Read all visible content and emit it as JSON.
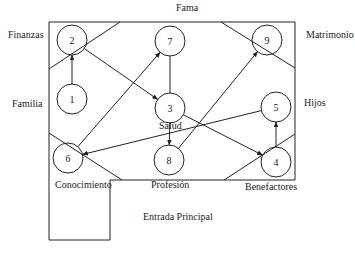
{
  "diagram": {
    "type": "bagua-map-graph",
    "regions": [
      {
        "id": "fama",
        "label": "Fama",
        "x": 176,
        "y": 8
      },
      {
        "id": "finanzas",
        "label": "Finanzas",
        "x": 8,
        "y": 35
      },
      {
        "id": "matrimonio",
        "label": "Matrimonio",
        "x": 306,
        "y": 35
      },
      {
        "id": "familia",
        "label": "Familia",
        "x": 12,
        "y": 104
      },
      {
        "id": "hijos",
        "label": "Hijos",
        "x": 304,
        "y": 103
      },
      {
        "id": "salud",
        "label": "Salud",
        "x": 159,
        "y": 126
      },
      {
        "id": "conocimiento",
        "label": "Conocimiento",
        "x": 55,
        "y": 185
      },
      {
        "id": "profesion",
        "label": "Profesión",
        "x": 151,
        "y": 185
      },
      {
        "id": "benefactores",
        "label": "Benefactores",
        "x": 245,
        "y": 187
      },
      {
        "id": "entrada",
        "label": "Entrada Principal",
        "x": 143,
        "y": 217
      }
    ],
    "nodes": [
      {
        "id": "1",
        "label": "1",
        "cx": 72,
        "cy": 99
      },
      {
        "id": "2",
        "label": "2",
        "cx": 72,
        "cy": 40
      },
      {
        "id": "3",
        "label": "3",
        "cx": 170,
        "cy": 108
      },
      {
        "id": "4",
        "label": "4",
        "cx": 276,
        "cy": 162
      },
      {
        "id": "5",
        "label": "5",
        "cx": 276,
        "cy": 107
      },
      {
        "id": "6",
        "label": "6",
        "cx": 68,
        "cy": 158
      },
      {
        "id": "7",
        "label": "7",
        "cx": 170,
        "cy": 41
      },
      {
        "id": "8",
        "label": "8",
        "cx": 169,
        "cy": 160
      },
      {
        "id": "9",
        "label": "9",
        "cx": 267,
        "cy": 40
      }
    ],
    "edges": [
      {
        "from": "1",
        "to": "2",
        "arrow": true
      },
      {
        "from": "2",
        "to": "3",
        "arrow": true
      },
      {
        "from": "3",
        "to": "4",
        "arrow": true
      },
      {
        "from": "3",
        "to": "8",
        "arrow": true
      },
      {
        "from": "6",
        "to": "7",
        "arrow": true
      },
      {
        "from": "8",
        "to": "9",
        "arrow": true
      },
      {
        "from": "5",
        "to": "6",
        "arrow": true
      },
      {
        "from": "4",
        "to": "5",
        "arrow": true
      },
      {
        "from": "7",
        "to": "3",
        "arrow": false
      }
    ]
  }
}
